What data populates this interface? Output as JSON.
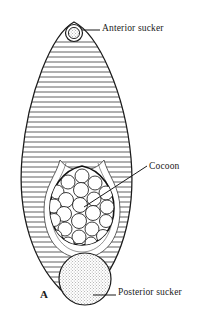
{
  "figure": {
    "panel_label": "A",
    "background_color": "#ffffff",
    "ink_color": "#1a1a1a"
  },
  "labels": {
    "anterior_sucker": "Anterior sucker",
    "cocoon": "Cocoon",
    "posterior_sucker": "Posterior sucker"
  },
  "structures": {
    "body": {
      "name": "leech-body",
      "shape": "pear-teardrop",
      "annulation_count": 55,
      "bounds": {
        "x1": 21,
        "y1": 22,
        "x2": 131,
        "y2": 300
      }
    },
    "anterior_sucker": {
      "name": "anterior-sucker",
      "cx": 74,
      "cy": 33,
      "r": 8,
      "inner_r": 5,
      "texture": "stippled"
    },
    "posterior_sucker": {
      "name": "posterior-sucker",
      "cx": 85,
      "cy": 279,
      "r": 26,
      "texture": "stippled"
    },
    "cocoon": {
      "name": "cocoon-sac",
      "cx": 82,
      "cy": 205,
      "rx": 32,
      "ry": 40,
      "egg_count": 25
    }
  },
  "leaders": {
    "anterior": {
      "x1": 82,
      "y1": 30,
      "x2": 100,
      "y2": 30
    },
    "cocoon": {
      "x1": 84,
      "y1": 207,
      "x2": 147,
      "y2": 165
    },
    "posterior": {
      "x1": 92,
      "y1": 295,
      "x2": 116,
      "y2": 295
    }
  }
}
